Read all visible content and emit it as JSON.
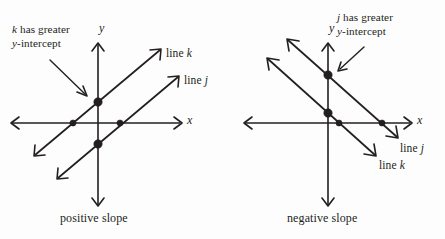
{
  "figure": {
    "background_color": "#fdfdfd",
    "ink_color": "#231f20"
  },
  "panels": [
    {
      "id": "left",
      "caption": "positive slope",
      "annotation_line1": "k has greater",
      "annotation_line2": "y-intercept",
      "annotation_var": "k",
      "annotation_var2": "y",
      "axis_x_label": "x",
      "axis_y_label": "y",
      "line_labels": [
        {
          "prefix": "line ",
          "name": "k"
        },
        {
          "prefix": "line ",
          "name": "j"
        }
      ],
      "origin": {
        "x": 98,
        "y": 123
      },
      "lines": [
        {
          "name": "k",
          "slope_sign": "positive",
          "y_intercept": "positive",
          "y_intercept_point": {
            "x": 98,
            "y": 102
          },
          "x_intercept_point": {
            "x": 73,
            "y": 123
          }
        },
        {
          "name": "j",
          "slope_sign": "positive",
          "y_intercept": "negative",
          "y_intercept_point": {
            "x": 98,
            "y": 144
          },
          "x_intercept_point": {
            "x": 120,
            "y": 123
          }
        }
      ]
    },
    {
      "id": "right",
      "caption": "negative slope",
      "annotation_line1": "j has greater",
      "annotation_line2": "y-intercept",
      "annotation_var": "j",
      "annotation_var2": "y",
      "axis_x_label": "x",
      "axis_y_label": "y",
      "line_labels": [
        {
          "prefix": "line ",
          "name": "j"
        },
        {
          "prefix": "line ",
          "name": "k"
        }
      ],
      "origin": {
        "x": 328,
        "y": 123
      },
      "lines": [
        {
          "name": "j",
          "slope_sign": "negative",
          "y_intercept": "positive-higher",
          "y_intercept_point": {
            "x": 328,
            "y": 75
          },
          "x_intercept_point": {
            "x": 382,
            "y": 123
          }
        },
        {
          "name": "k",
          "slope_sign": "negative",
          "y_intercept": "positive-lower",
          "y_intercept_point": {
            "x": 328,
            "y": 113
          },
          "x_intercept_point": {
            "x": 339,
            "y": 123
          }
        }
      ]
    }
  ]
}
